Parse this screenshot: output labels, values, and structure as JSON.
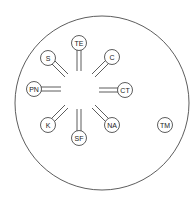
{
  "diagram": {
    "outer": {
      "cx": 102,
      "cy": 103,
      "r": 87
    },
    "hub": {
      "cx": 80,
      "cy": 90,
      "r": 19
    },
    "nodes": [
      {
        "label": "TE",
        "x": 79,
        "y": 43
      },
      {
        "label": "C",
        "x": 112,
        "y": 57
      },
      {
        "label": "CT",
        "x": 125,
        "y": 90
      },
      {
        "label": "NA",
        "x": 112,
        "y": 125
      },
      {
        "label": "SF",
        "x": 79,
        "y": 138
      },
      {
        "label": "K",
        "x": 48,
        "y": 125
      },
      {
        "label": "PN",
        "x": 34,
        "y": 89
      },
      {
        "label": "S",
        "x": 48,
        "y": 58
      }
    ],
    "isolated": {
      "label": "TM",
      "x": 165,
      "y": 125
    }
  }
}
